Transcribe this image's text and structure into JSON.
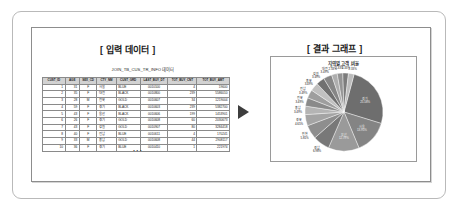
{
  "sections": {
    "left_title": "[ 입력 데이터 ]",
    "right_title": "[ 결과 그래프 ]"
  },
  "table": {
    "caption": "JOIN_TB_CUS_TR_INFO 데이터",
    "ellipsis": "···",
    "columns": [
      "CUST_ID",
      "AGE",
      "SEX_CD",
      "CTY_NM",
      "CUST_GRD",
      "LAST_BUY_DT",
      "TOT_BUY_CNT",
      "TOT_BUY_AMT"
    ],
    "rows": [
      [
        "1",
        "31",
        "F",
        "서울",
        "BLUE",
        "0010100",
        "4",
        "19600"
      ],
      [
        "2",
        "35",
        "F",
        "대전",
        "BLACK",
        "0010800",
        "239",
        "5586010"
      ],
      [
        "3",
        "28",
        "M",
        "전북",
        "GOLD",
        "0010607",
        "34",
        "1219004"
      ],
      [
        "4",
        "59",
        "F",
        "경기",
        "BLACK",
        "0010603",
        "239",
        "5382700"
      ],
      [
        "5",
        "43",
        "F",
        "울산",
        "BLACK",
        "0010606",
        "199",
        "1453901"
      ],
      [
        "6",
        "26",
        "F",
        "경기",
        "GOLD",
        "0010608",
        "60",
        "2030673"
      ],
      [
        "7",
        "43",
        "F",
        "강원",
        "GOLD",
        "0010907",
        "80",
        "3284418"
      ],
      [
        "8",
        "40",
        "F",
        "전남",
        "BLUE",
        "0010611",
        "4",
        "170241"
      ],
      [
        "9",
        "33",
        "M",
        "충남",
        "GOLD",
        "0010608",
        "44",
        "2908117"
      ],
      [
        "10",
        "36",
        "F",
        "경기",
        "BLUE",
        "0010410",
        "1",
        "221974"
      ]
    ]
  },
  "chart_data": {
    "type": "pie",
    "title": "지역별 고객 비율",
    "categories": [
      "경기",
      "서울",
      "부산",
      "경남",
      "인천",
      "경북",
      "충남",
      "전북",
      "전남",
      "충북",
      "강원",
      "대전",
      "광주",
      "대구",
      "울산",
      "제주"
    ],
    "values": [
      22.0,
      12.0,
      11.0,
      6.0,
      5.0,
      4.0,
      3.0,
      3.0,
      3.0,
      3.0,
      3.0,
      3.0,
      2.0,
      2.0,
      2.0,
      2.0
    ],
    "labels": [
      "경기\n22.00%",
      "서울\n12.00%",
      "부산\n11.00%",
      "경남\n6.00%",
      "인천\n5.00%",
      "경북\n4.00%",
      "충남\n3.00%",
      "전북\n3.00%",
      "전남\n3.00%",
      "충북\n3.00%",
      "강원\n3.00%",
      "대전\n3.00%"
    ],
    "legend": "none",
    "grid": false
  }
}
